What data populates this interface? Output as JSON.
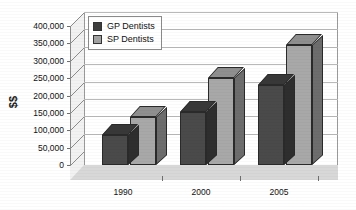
{
  "chart_data": {
    "type": "bar",
    "title": "",
    "xlabel": "",
    "ylabel": "$$",
    "categories": [
      "1990",
      "2000",
      "2005"
    ],
    "series": [
      {
        "name": "GP Dentists",
        "color": "#4a4a4a",
        "values": [
          85000,
          152000,
          230000
        ]
      },
      {
        "name": "SP Dentists",
        "color": "#a8a8a8",
        "values": [
          137000,
          250000,
          345000
        ]
      }
    ],
    "ylim": [
      0,
      400000
    ],
    "ytick_values": [
      0,
      50000,
      100000,
      150000,
      200000,
      250000,
      300000,
      350000,
      400000
    ],
    "ytick_labels": [
      "0",
      "50,000",
      "100,000",
      "150,000",
      "200,000",
      "250,000",
      "300,000",
      "350,000",
      "400,000"
    ],
    "grid": true,
    "legend_position": "top-left-inside",
    "style": "3d-clustered-column"
  },
  "legend": {
    "items": [
      {
        "label": "GP Dentists",
        "swatch": "gp"
      },
      {
        "label": "SP Dentists",
        "swatch": "sp"
      }
    ]
  },
  "axis": {
    "y_title": "$$"
  }
}
